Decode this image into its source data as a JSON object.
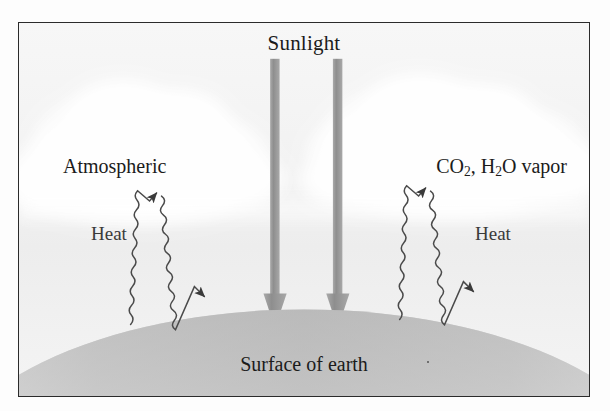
{
  "figure": {
    "background_color": "#f4f4f4",
    "frame_color": "#2b2b2b"
  },
  "labels": {
    "sunlight": "Sunlight",
    "atmospheric": "Atmospheric",
    "gases_prefix": "CO",
    "gases_sub1": "2",
    "gases_mid": ", H",
    "gases_sub2": "2",
    "gases_suffix": "O vapor",
    "heat_left": "Heat",
    "heat_right": "Heat",
    "surface": "Surface of earth"
  },
  "elements": {
    "sunlight_arrow_left": "downward gray arrow",
    "sunlight_arrow_right": "downward gray arrow",
    "heat_arrow_left": "wavy heat ray up and back down",
    "heat_arrow_right": "wavy heat ray up and back down",
    "earth": "curved earth surface",
    "cloud_left": "cloud",
    "cloud_right": "cloud"
  },
  "colors": {
    "arrow_gray": "#9a9a9a",
    "arrow_gray_dark": "#8c8c8c",
    "squiggle": "#4a4a4a",
    "earth_top": "#b9b9b9",
    "earth_bottom": "#f0f0f0",
    "cloud": "#ffffff",
    "text": "#1b1b1b"
  }
}
